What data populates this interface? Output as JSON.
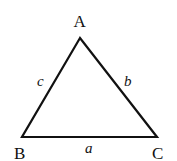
{
  "diagram": {
    "type": "triangle",
    "stroke_color": "#111111",
    "vertices": [
      {
        "id": "A",
        "label": "A",
        "x": 80,
        "y": 38
      },
      {
        "id": "B",
        "label": "B",
        "x": 22,
        "y": 137
      },
      {
        "id": "C",
        "label": "C",
        "x": 157,
        "y": 137
      }
    ],
    "sides": [
      {
        "id": "a",
        "label": "a",
        "between": [
          "B",
          "C"
        ]
      },
      {
        "id": "b",
        "label": "b",
        "between": [
          "A",
          "C"
        ]
      },
      {
        "id": "c",
        "label": "c",
        "between": [
          "A",
          "B"
        ]
      }
    ]
  }
}
